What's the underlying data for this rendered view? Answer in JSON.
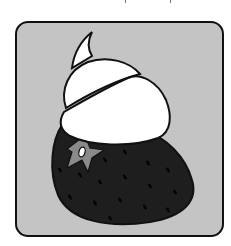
{
  "illustration": {
    "subject": "strawberry topped with whipped cream",
    "colors": {
      "background": "#ffffff",
      "panel": "#c4c4c4",
      "outline": "#111111",
      "strawberry": "#1e1e1e",
      "seeds": "#050505",
      "cream": "#ffffff",
      "calyx_star": "#8a8a8a"
    },
    "icons": {
      "strawberry": "strawberry-icon",
      "cream": "whipped-cream-icon",
      "star": "calyx-star-icon"
    }
  }
}
